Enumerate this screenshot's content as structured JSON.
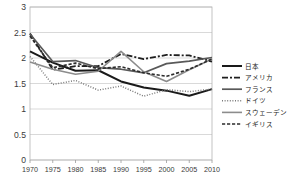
{
  "chart_data": {
    "type": "line",
    "title": "",
    "subtitle": "",
    "xlabel": "",
    "ylabel": "",
    "xlim": [
      1970,
      2010
    ],
    "ylim": [
      0,
      3
    ],
    "grid": true,
    "legend_position": "right",
    "x": [
      1970,
      1975,
      1980,
      1985,
      1990,
      1995,
      2000,
      2005,
      2010
    ],
    "xtick_labels": [
      "1970",
      "1975",
      "1980",
      "1985",
      "1990",
      "1995",
      "2000",
      "2005",
      "2010"
    ],
    "ytick_labels": [
      "0",
      "0.5",
      "1",
      "1.5",
      "2",
      "2.5",
      "3"
    ],
    "ytick_values": [
      0,
      0.5,
      1,
      1.5,
      2,
      2.5,
      3
    ],
    "series": [
      {
        "name": "日本",
        "style": "solid",
        "color": "#1a1a1a",
        "width": 2.0,
        "dash": "",
        "values": [
          2.13,
          1.91,
          1.75,
          1.76,
          1.54,
          1.42,
          1.36,
          1.26,
          1.39
        ]
      },
      {
        "name": "アメリカ",
        "style": "dash-dot",
        "color": "#1f1f1f",
        "width": 1.8,
        "dash": "6 2 2 2",
        "values": [
          2.48,
          1.77,
          1.84,
          1.84,
          2.08,
          1.98,
          2.06,
          2.05,
          1.93
        ]
      },
      {
        "name": "フランス",
        "style": "solid",
        "color": "#595959",
        "width": 1.7,
        "dash": "",
        "values": [
          2.47,
          1.93,
          1.95,
          1.81,
          1.78,
          1.71,
          1.89,
          1.94,
          2.01
        ]
      },
      {
        "name": "ドイツ",
        "style": "dotted",
        "color": "#7a7a7a",
        "width": 1.5,
        "dash": "1 1.6",
        "values": [
          2.03,
          1.48,
          1.56,
          1.37,
          1.45,
          1.25,
          1.38,
          1.34,
          1.39
        ]
      },
      {
        "name": "スウェーデン",
        "style": "solid",
        "color": "#8c8c8c",
        "width": 1.6,
        "dash": "",
        "values": [
          1.92,
          1.78,
          1.68,
          1.74,
          2.13,
          1.73,
          1.54,
          1.77,
          1.98
        ]
      },
      {
        "name": "イギリス",
        "style": "dashed",
        "color": "#2b2b2b",
        "width": 1.6,
        "dash": "3.2 1.8",
        "values": [
          2.43,
          1.81,
          1.9,
          1.79,
          1.83,
          1.71,
          1.64,
          1.78,
          1.98
        ]
      }
    ]
  },
  "legend": {
    "items": [
      {
        "label": "日本"
      },
      {
        "label": "アメリカ"
      },
      {
        "label": "フランス"
      },
      {
        "label": "ドイツ"
      },
      {
        "label": "スウェーデン"
      },
      {
        "label": "イギリス"
      }
    ]
  },
  "colors": {
    "background": "#ffffff",
    "grid": "#c8c8c8",
    "axis": "#9a9a9a",
    "text": "#3a3a3a"
  }
}
